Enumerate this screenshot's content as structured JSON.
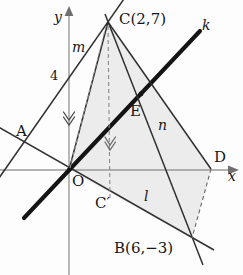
{
  "figure": {
    "type": "coordinate-geometry-diagram",
    "background_color": "#fdfdfd",
    "shaded_region_color": "#ececec",
    "stroke_color": "#1a1a1a",
    "axis_color": "#8c8c8c"
  },
  "axes": {
    "x_label": "x",
    "y_label": "y",
    "origin_label": "O",
    "tick_label_y4": "4",
    "x_axis_pixel_y": 170,
    "y_axis_pixel_x": 69,
    "unit_pixels_x": 20.5,
    "unit_pixels_y": 21.2
  },
  "points": [
    {
      "name": "C",
      "label": "C(2,7)",
      "x": 2,
      "y": 7,
      "px": 108,
      "py": 22,
      "label_px": 118,
      "label_py": 13
    },
    {
      "name": "B",
      "label": "B(6,−3)",
      "x": 6,
      "y": -3,
      "px": 192,
      "py": 238,
      "label_px": 118,
      "label_py": 243
    },
    {
      "name": "A",
      "label": "A",
      "px": 30,
      "py": 144,
      "label_px": 16,
      "label_py": 126
    },
    {
      "name": "D",
      "label": "D",
      "px": 211,
      "py": 169,
      "label_px": 215,
      "label_py": 152
    },
    {
      "name": "E",
      "label": "E",
      "px": 141,
      "py": 94,
      "label_px": 131,
      "label_py": 104
    },
    {
      "name": "O",
      "label": "O",
      "px": 69,
      "py": 170,
      "label_px": 72,
      "label_py": 174
    },
    {
      "name": "Cp",
      "label": "C′",
      "px": 111,
      "py": 196,
      "label_px": 98,
      "label_py": 196
    }
  ],
  "lines": [
    {
      "name": "k",
      "label": "k",
      "label_px": 203,
      "label_py": 20,
      "style": "thick"
    },
    {
      "name": "l",
      "label": "l",
      "label_px": 146,
      "label_py": 196,
      "style": "thin"
    },
    {
      "name": "m",
      "label": "m",
      "label_px": 74,
      "label_py": 45,
      "style": "thin"
    },
    {
      "name": "n",
      "label": "n",
      "label_px": 160,
      "label_py": 122,
      "style": "thin"
    }
  ],
  "marks": {
    "parallel_chevrons": "double-chevron",
    "chevron_positions": [
      [
        69,
        118
      ],
      [
        111,
        143
      ]
    ]
  },
  "labels": {
    "x_axis": "x",
    "y_axis": "y",
    "origin": "O",
    "tick_4": "4",
    "point_a": "A",
    "point_d": "D",
    "point_e": "E",
    "point_c_prime": "C′",
    "point_c": "C(2,7)",
    "point_b": "B(6,−3)",
    "line_k": "k",
    "line_l": "l",
    "line_m": "m",
    "line_n": "n"
  }
}
